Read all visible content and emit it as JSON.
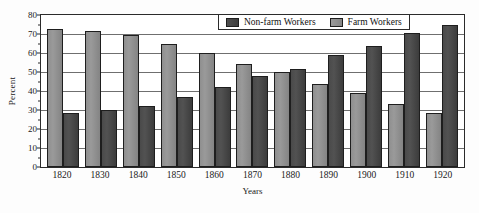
{
  "chart_data": {
    "type": "bar",
    "title": "",
    "xlabel": "Years",
    "ylabel": "Percent",
    "ylim": [
      0,
      80
    ],
    "yticks": [
      0,
      10,
      20,
      30,
      40,
      50,
      60,
      70,
      80
    ],
    "grid": true,
    "legend_position": "top-right-inside",
    "categories": [
      "1820",
      "1830",
      "1840",
      "1850",
      "1860",
      "1870",
      "1880",
      "1890",
      "1900",
      "1910",
      "1920"
    ],
    "series": [
      {
        "name": "Farm Workers",
        "color": "#8f8f8f",
        "values": [
          71.5,
          70.5,
          68.5,
          64,
          59,
          53.5,
          49.5,
          43,
          38.5,
          32.5,
          28
        ]
      },
      {
        "name": "Non-farm Workers",
        "color": "#474747",
        "values": [
          28,
          29.5,
          31.5,
          36.5,
          41.5,
          47.5,
          51,
          58,
          63,
          69.5,
          74
        ]
      }
    ]
  },
  "legend": {
    "items": [
      {
        "label": "Non-farm Workers",
        "swatch": "dark-gray-swatch"
      },
      {
        "label": "Farm Workers",
        "swatch": "light-gray-swatch"
      }
    ]
  }
}
